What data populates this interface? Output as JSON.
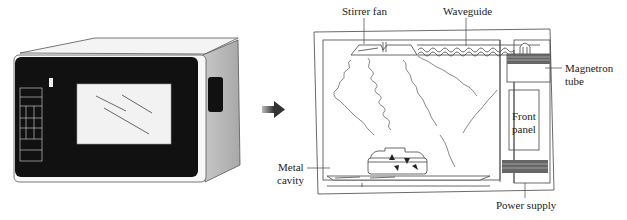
{
  "figure": {
    "left_panel": {
      "subject": "microwave-oven-exterior",
      "parts": [
        "door window",
        "keypad",
        "side vent"
      ]
    },
    "arrow": {
      "direction": "right",
      "color": "#555555"
    },
    "right_panel": {
      "subject": "microwave-oven-cross-section",
      "labels": {
        "stirrer_fan": "Stirrer fan",
        "waveguide": "Waveguide",
        "magnetron_line1": "Magnetron",
        "magnetron_line2": "tube",
        "front_panel_line1": "Front",
        "front_panel_line2": "panel",
        "metal_cavity_line1": "Metal",
        "metal_cavity_line2": "cavity",
        "power_supply": "Power supply"
      }
    }
  }
}
